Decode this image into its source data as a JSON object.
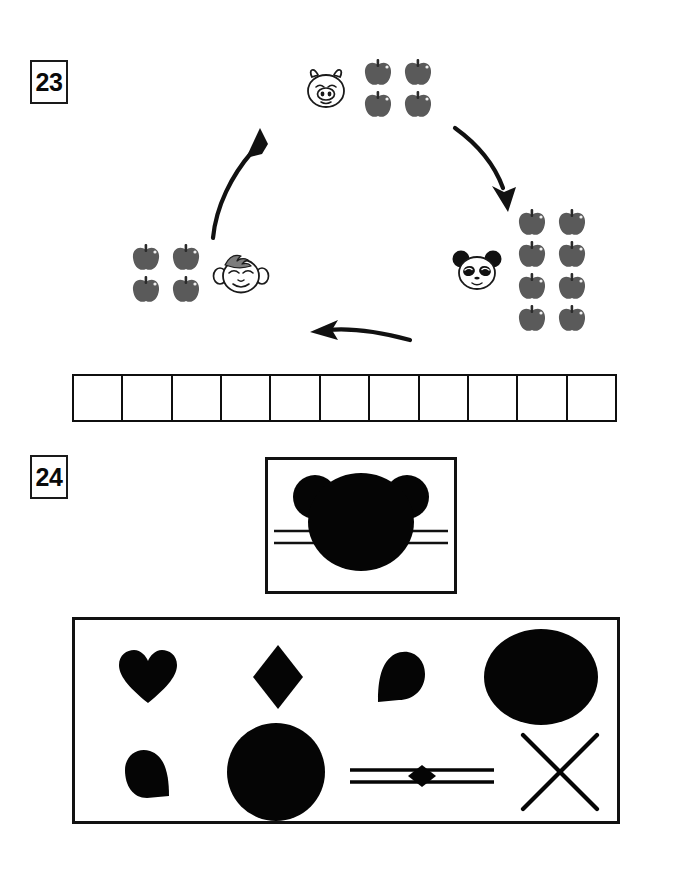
{
  "page": {
    "background": "#ffffff",
    "ink": "#111111",
    "apple_color": "#5a5a5a",
    "apple_stem_color": "#2b2b2b"
  },
  "questions": [
    {
      "number": "23",
      "type": "cycle-diagram",
      "nodes": [
        {
          "id": "pig",
          "animal": "pig",
          "animal_label": "pig-face",
          "apple_count": 4,
          "apple_rows": 2,
          "apple_cols": 2,
          "position": "top"
        },
        {
          "id": "panda",
          "animal": "panda",
          "animal_label": "panda-face",
          "apple_count": 8,
          "apple_rows": 4,
          "apple_cols": 2,
          "position": "right"
        },
        {
          "id": "monkey",
          "animal": "monkey",
          "animal_label": "monkey-face",
          "apple_count": 4,
          "apple_rows": 2,
          "apple_cols": 2,
          "position": "left"
        }
      ],
      "arrows": [
        {
          "id": "arrow-pig-to-panda",
          "from": "pig",
          "to": "panda",
          "direction": "down-right"
        },
        {
          "id": "arrow-panda-to-monkey",
          "from": "panda",
          "to": "monkey",
          "direction": "left"
        },
        {
          "id": "arrow-monkey-to-pig",
          "from": "monkey",
          "to": "pig",
          "direction": "up-right"
        }
      ],
      "answer_strip": {
        "cells": 11,
        "values": [
          "",
          "",
          "",
          "",
          "",
          "",
          "",
          "",
          "",
          "",
          ""
        ]
      }
    },
    {
      "number": "24",
      "type": "shape-match",
      "target_box": {
        "figure": "cat-head-silhouette",
        "whiskers_per_side": 2
      },
      "shape_panel": {
        "rows": 2,
        "cols": 4,
        "shapes": [
          {
            "id": "heart",
            "name": "heart-shape",
            "row": 1,
            "col": 1
          },
          {
            "id": "diamond",
            "name": "diamond-shape",
            "row": 1,
            "col": 2
          },
          {
            "id": "teardrop-right",
            "name": "teardrop-shape",
            "row": 1,
            "col": 3
          },
          {
            "id": "ellipse",
            "name": "ellipse-shape",
            "row": 1,
            "col": 4
          },
          {
            "id": "teardrop-down",
            "name": "teardrop-shape-2",
            "row": 2,
            "col": 1
          },
          {
            "id": "circle",
            "name": "circle-shape",
            "row": 2,
            "col": 2
          },
          {
            "id": "lines-diamond",
            "name": "parallel-lines-with-diamond-shape",
            "row": 2,
            "col": 3
          },
          {
            "id": "cross",
            "name": "x-cross-shape",
            "row": 2,
            "col": 4
          }
        ]
      }
    }
  ]
}
